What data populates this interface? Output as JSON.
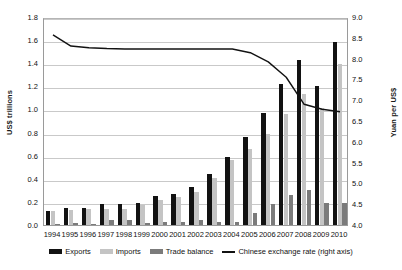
{
  "chart_data": {
    "type": "bar",
    "title": "",
    "subtitle": "",
    "xlabel": "",
    "ylabel": "US$ trillions",
    "ylabel_right": "Yuan per US$",
    "ylim": [
      0.0,
      1.8
    ],
    "ylim_right": [
      4.0,
      9.0
    ],
    "ytick_step": 0.2,
    "ytick_step_right": 0.5,
    "grid": true,
    "legend_position": "bottom",
    "categories": [
      "1994",
      "1995",
      "1996",
      "1997",
      "1998",
      "1999",
      "2000",
      "2001",
      "2002",
      "2003",
      "2004",
      "2005",
      "2006",
      "2007",
      "2008",
      "2009",
      "2010"
    ],
    "yticks_left": [
      "0.0",
      "0.2",
      "0.4",
      "0.6",
      "0.8",
      "1.0",
      "1.2",
      "1.4",
      "1.6",
      "1.8"
    ],
    "yticks_right": [
      "4.0",
      "4.5",
      "5.0",
      "5.5",
      "6.0",
      "6.5",
      "7.0",
      "7.5",
      "8.0",
      "8.5",
      "9.0"
    ],
    "series": [
      {
        "name": "Exports",
        "axis": "left",
        "color": "#121212",
        "values": [
          0.12,
          0.15,
          0.15,
          0.18,
          0.18,
          0.19,
          0.25,
          0.27,
          0.33,
          0.44,
          0.59,
          0.76,
          0.97,
          1.22,
          1.43,
          1.2,
          1.58
        ]
      },
      {
        "name": "Imports",
        "axis": "left",
        "color": "#c4c4c4",
        "values": [
          0.12,
          0.13,
          0.14,
          0.14,
          0.14,
          0.17,
          0.22,
          0.24,
          0.29,
          0.41,
          0.56,
          0.66,
          0.79,
          0.96,
          1.13,
          1.01,
          1.39
        ]
      },
      {
        "name": "Trade balance",
        "axis": "left",
        "color": "#7b7b7b",
        "values": [
          0.01,
          0.02,
          0.01,
          0.04,
          0.04,
          0.02,
          0.03,
          0.03,
          0.04,
          0.03,
          0.03,
          0.1,
          0.18,
          0.26,
          0.3,
          0.19,
          0.19
        ]
      },
      {
        "name": "Chinese exchange rate (right axis)",
        "axis": "right",
        "type": "line",
        "color": "#121212",
        "values": [
          8.62,
          8.35,
          8.31,
          8.29,
          8.28,
          8.28,
          8.28,
          8.28,
          8.28,
          8.28,
          8.28,
          8.19,
          7.97,
          7.6,
          6.95,
          6.83,
          6.77
        ]
      }
    ]
  },
  "legend": {
    "items": [
      {
        "label": "Exports",
        "swatch": "bar-exports"
      },
      {
        "label": "Imports",
        "swatch": "bar-imports"
      },
      {
        "label": "Trade balance",
        "swatch": "bar-balance"
      },
      {
        "label": "Chinese exchange rate (right axis)",
        "swatch": "line"
      }
    ]
  }
}
